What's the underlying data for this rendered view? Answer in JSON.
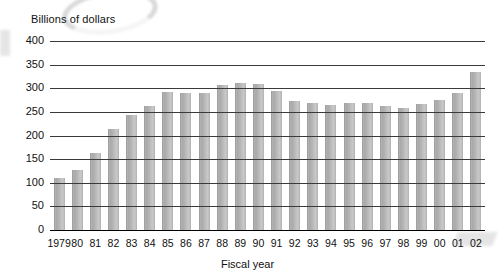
{
  "chart_data": {
    "type": "bar",
    "title": "",
    "ylabel": "Billions of dollars",
    "xlabel": "Fiscal year",
    "ylim": [
      0,
      400
    ],
    "yticks": [
      0,
      50,
      100,
      150,
      200,
      250,
      300,
      350,
      400
    ],
    "grid": true,
    "legend": null,
    "bar_color": "#b8b8b8",
    "categories": [
      "1979",
      "80",
      "81",
      "82",
      "83",
      "84",
      "85",
      "86",
      "87",
      "88",
      "89",
      "90",
      "91",
      "92",
      "93",
      "94",
      "95",
      "96",
      "97",
      "98",
      "99",
      "00",
      "01",
      "02"
    ],
    "values": [
      110,
      128,
      163,
      213,
      243,
      263,
      292,
      290,
      291,
      307,
      312,
      309,
      295,
      272,
      268,
      264,
      268,
      269,
      262,
      258,
      266,
      276,
      290,
      334
    ]
  },
  "axes": {
    "y_title": "Billions of dollars",
    "x_title": "Fiscal year"
  }
}
